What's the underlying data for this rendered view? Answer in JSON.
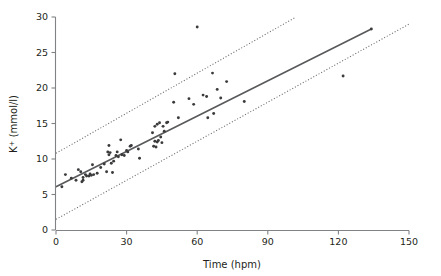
{
  "chart_data": {
    "type": "scatter",
    "title": "",
    "subtitle": "",
    "xlabel": "Time (hpm)",
    "ylabel": "K+ (mmol/l)",
    "ylabel_base": "K",
    "ylabel_superscript": "+",
    "ylabel_unit": " (mmol/l)",
    "xlim": [
      0,
      150
    ],
    "ylim": [
      0,
      30
    ],
    "xticks": [
      0,
      30,
      60,
      90,
      120,
      150
    ],
    "yticks": [
      0,
      5,
      10,
      15,
      20,
      25,
      30
    ],
    "xtick_labels": [
      "0",
      "30",
      "60",
      "90",
      "120",
      "150"
    ],
    "ytick_labels": [
      "0",
      "5",
      "10",
      "15",
      "20",
      "25",
      "30"
    ],
    "grid": false,
    "legend": false,
    "legend_position": "none",
    "marker": "small-dot",
    "marker_color": "#3b3b3d",
    "line_color": "#58595b",
    "band_color": "#6d6e71",
    "axis_color": "#808285",
    "series": [
      {
        "name": "Observations",
        "type": "scatter",
        "points": [
          [
            2.5,
            6.1
          ],
          [
            4.0,
            7.8
          ],
          [
            6.5,
            7.3
          ],
          [
            8.5,
            7.0
          ],
          [
            9.5,
            8.5
          ],
          [
            10.5,
            8.2
          ],
          [
            11.0,
            6.8
          ],
          [
            11.5,
            7.0
          ],
          [
            11.5,
            7.4
          ],
          [
            12.5,
            7.8
          ],
          [
            13.0,
            7.6
          ],
          [
            14.0,
            7.6
          ],
          [
            14.5,
            7.9
          ],
          [
            15.0,
            7.7
          ],
          [
            15.5,
            9.2
          ],
          [
            16.0,
            7.8
          ],
          [
            17.5,
            8.0
          ],
          [
            19.0,
            8.8
          ],
          [
            20.5,
            9.3
          ],
          [
            21.5,
            8.2
          ],
          [
            22.0,
            11.0
          ],
          [
            22.5,
            11.9
          ],
          [
            22.5,
            10.6
          ],
          [
            23.0,
            10.9
          ],
          [
            23.5,
            9.4
          ],
          [
            24.0,
            8.1
          ],
          [
            24.5,
            9.7
          ],
          [
            25.5,
            10.5
          ],
          [
            26.0,
            11.0
          ],
          [
            26.5,
            10.3
          ],
          [
            27.5,
            12.7
          ],
          [
            28.0,
            10.6
          ],
          [
            29.0,
            10.5
          ],
          [
            30.0,
            11.2
          ],
          [
            30.5,
            11.0
          ],
          [
            31.5,
            11.8
          ],
          [
            32.0,
            11.9
          ],
          [
            35.0,
            11.4
          ],
          [
            35.5,
            10.1
          ],
          [
            41.0,
            13.7
          ],
          [
            41.5,
            11.8
          ],
          [
            42.0,
            12.5
          ],
          [
            42.0,
            14.6
          ],
          [
            42.5,
            11.7
          ],
          [
            43.0,
            12.4
          ],
          [
            43.0,
            14.9
          ],
          [
            43.5,
            12.6
          ],
          [
            44.0,
            15.1
          ],
          [
            44.5,
            13.1
          ],
          [
            45.0,
            12.3
          ],
          [
            45.5,
            14.6
          ],
          [
            46.0,
            13.9
          ],
          [
            47.0,
            15.1
          ],
          [
            47.5,
            15.2
          ],
          [
            50.0,
            18.0
          ],
          [
            50.5,
            22.0
          ],
          [
            52.0,
            15.8
          ],
          [
            56.5,
            18.5
          ],
          [
            58.5,
            17.7
          ],
          [
            60.0,
            28.6
          ],
          [
            62.5,
            19.0
          ],
          [
            64.0,
            18.8
          ],
          [
            64.5,
            15.8
          ],
          [
            66.5,
            22.1
          ],
          [
            67.0,
            16.4
          ],
          [
            68.5,
            19.8
          ],
          [
            70.0,
            18.6
          ],
          [
            72.5,
            20.9
          ],
          [
            80.0,
            18.1
          ],
          [
            122.0,
            21.7
          ],
          [
            134.0,
            28.3
          ]
        ]
      },
      {
        "name": "Regression line",
        "type": "line",
        "points": [
          [
            0,
            6.1
          ],
          [
            134,
            28.3
          ]
        ]
      },
      {
        "name": "Upper prediction band",
        "type": "dotted-line",
        "points": [
          [
            0,
            10.8
          ],
          [
            102,
            30.0
          ]
        ]
      },
      {
        "name": "Lower prediction band",
        "type": "dotted-line",
        "points": [
          [
            0,
            1.5
          ],
          [
            150,
            29.0
          ]
        ]
      }
    ],
    "annotations": []
  },
  "figure": {
    "background_color": "#ffffff",
    "text_color": "#231f20"
  }
}
